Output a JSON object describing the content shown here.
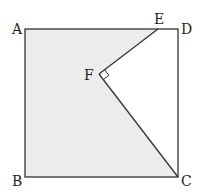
{
  "diagram": {
    "type": "geometry",
    "colors": {
      "stroke": "#333333",
      "fill": "#ececec",
      "background": "#ffffff"
    },
    "points": {
      "A": {
        "label": "A",
        "x": 25,
        "y": 29
      },
      "D": {
        "label": "D",
        "x": 178,
        "y": 29
      },
      "B": {
        "label": "B",
        "x": 25,
        "y": 177
      },
      "C": {
        "label": "C",
        "x": 178,
        "y": 177
      },
      "E": {
        "label": "E",
        "x": 158,
        "y": 29
      },
      "F": {
        "label": "F",
        "x": 99,
        "y": 74
      }
    },
    "right_angle": {
      "at": "F",
      "between": [
        "E",
        "C"
      ]
    },
    "shaded_region": [
      "A",
      "E",
      "F",
      "C",
      "B"
    ]
  }
}
